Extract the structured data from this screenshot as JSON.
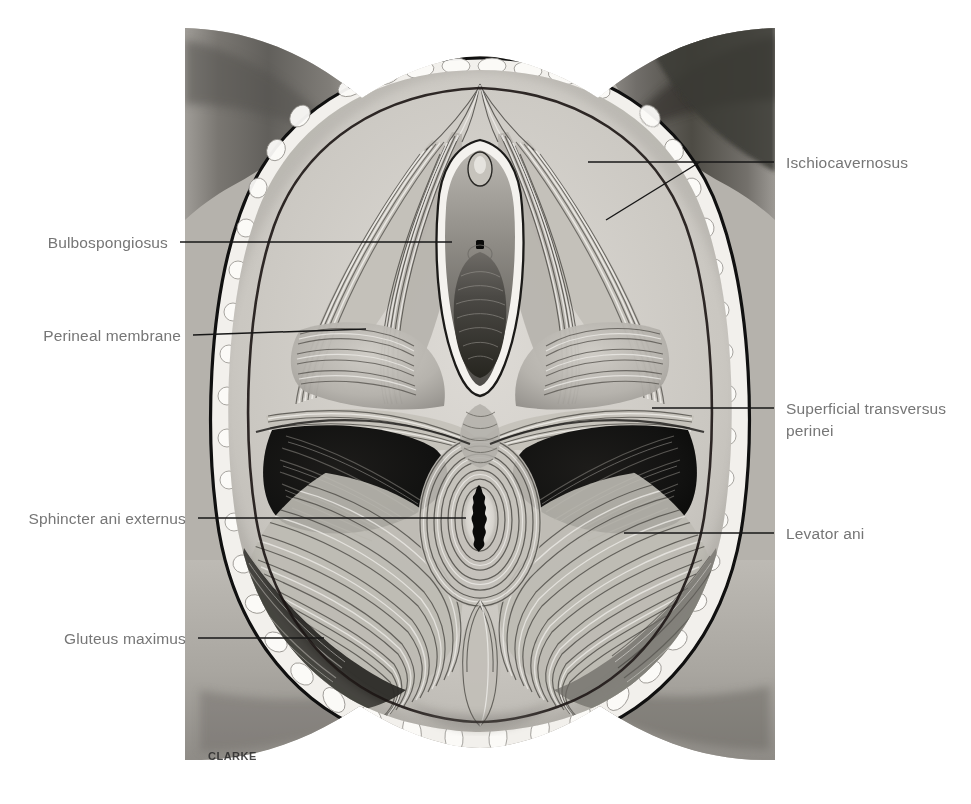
{
  "figure": {
    "kind": "anatomical-illustration",
    "view": "lithotomy / inferior view",
    "signature": "CLARKE",
    "palette": {
      "page_background": "#ffffff",
      "skin_light": "#d7d4cf",
      "skin_mid": "#a8a49e",
      "thigh_dark": "#4a4946",
      "fascia_white": "#f4f2ee",
      "muscle_mid": "#b9b5ae",
      "muscle_shadow": "#6d6a65",
      "fossa_black": "#141414",
      "outline": "#111111",
      "label_text": "#767676",
      "leader_line": "#171717"
    }
  },
  "labels": {
    "left": [
      {
        "id": "bulbospongiosus",
        "text": "Bulbospongiosus",
        "text_x": 168,
        "text_y": 248,
        "leader": [
          [
            180,
            242
          ],
          [
            452,
            242
          ]
        ]
      },
      {
        "id": "perineal-membrane",
        "text": "Perineal membrane",
        "text_x": 181,
        "text_y": 341,
        "leader": [
          [
            193,
            335
          ],
          [
            366,
            329
          ]
        ]
      },
      {
        "id": "sphincter-ani-externus",
        "text": "Sphincter ani externus",
        "text_x": 186,
        "text_y": 524,
        "leader": [
          [
            198,
            518
          ],
          [
            466,
            518
          ]
        ]
      },
      {
        "id": "gluteus-maximus",
        "text": "Gluteus maximus",
        "text_x": 186,
        "text_y": 644,
        "leader": [
          [
            198,
            638
          ],
          [
            324,
            638
          ]
        ]
      }
    ],
    "right": [
      {
        "id": "ischiocavernosus",
        "text": "Ischiocavernosus",
        "text_x": 786,
        "text_y": 168,
        "leader_main": [
          [
            774,
            162
          ],
          [
            588,
            162
          ]
        ],
        "leader_branch": [
          [
            700,
            162
          ],
          [
            606,
            220
          ]
        ]
      },
      {
        "id": "superficial-transversus-perinei",
        "text_line1": "Superficial transversus",
        "text_line2": "perinei",
        "text_x": 786,
        "text_y": 414,
        "line_gap": 22,
        "leader": [
          [
            774,
            408
          ],
          [
            652,
            408
          ]
        ]
      },
      {
        "id": "levator-ani",
        "text": "Levator ani",
        "text_x": 786,
        "text_y": 539,
        "leader": [
          [
            774,
            533
          ],
          [
            624,
            533
          ]
        ]
      }
    ]
  }
}
